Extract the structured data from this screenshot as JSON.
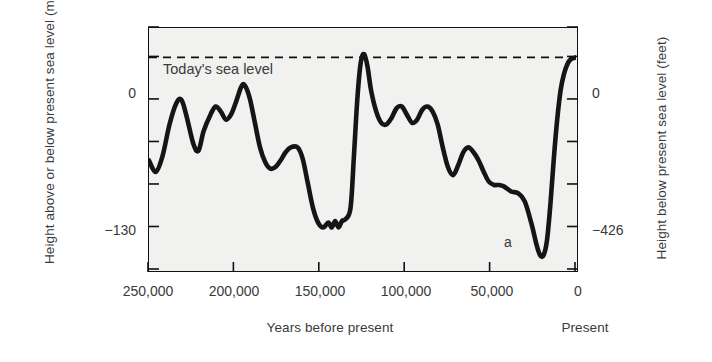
{
  "chart_data": {
    "type": "line",
    "title": "",
    "subtitle": "",
    "xlabel": "Years before present",
    "xlabel_right": "Present",
    "ylabel": "Height above or below present sea level (meters)",
    "ylabel_right": "Height below present sea level (feet)",
    "grid": false,
    "legend": "none",
    "xlim": [
      250000,
      0
    ],
    "ylim": [
      -130,
      18
    ],
    "y2lim": [
      -426,
      59
    ],
    "x_ticks": [
      250000,
      200000,
      150000,
      100000,
      50000,
      0
    ],
    "x_tick_labels": [
      "250,000",
      "200,000",
      "150,000",
      "100,000",
      "50,000",
      "0"
    ],
    "y_ticks": [
      0,
      -130
    ],
    "y_tick_labels": [
      "0",
      "−130"
    ],
    "y2_ticks": [
      0,
      -426
    ],
    "y2_tick_labels": [
      "0",
      "−426"
    ],
    "y_minor_ticks": [
      18,
      -26,
      -52,
      -78,
      -104
    ],
    "annotations": [
      {
        "text": "Today's sea level",
        "x": 232000,
        "y": 12
      },
      {
        "text": "a",
        "x": 17000,
        "y": -122
      }
    ],
    "reference_lines": [
      {
        "y": 0,
        "style": "dashed",
        "label": "Today's sea level"
      }
    ],
    "series": [
      {
        "name": "Sea level",
        "color": "#151515",
        "points": [
          [
            250000,
            -63
          ],
          [
            246000,
            -70
          ],
          [
            242000,
            -60
          ],
          [
            238000,
            -41
          ],
          [
            234000,
            -28
          ],
          [
            231000,
            -26
          ],
          [
            228000,
            -36
          ],
          [
            224000,
            -53
          ],
          [
            221000,
            -57
          ],
          [
            218000,
            -45
          ],
          [
            214000,
            -35
          ],
          [
            211000,
            -30
          ],
          [
            208000,
            -33
          ],
          [
            205000,
            -38
          ],
          [
            202000,
            -35
          ],
          [
            199000,
            -27
          ],
          [
            196000,
            -18
          ],
          [
            194000,
            -17
          ],
          [
            191000,
            -25
          ],
          [
            188000,
            -40
          ],
          [
            185000,
            -55
          ],
          [
            182000,
            -64
          ],
          [
            179000,
            -68
          ],
          [
            176000,
            -67
          ],
          [
            173000,
            -63
          ],
          [
            170000,
            -58
          ],
          [
            167000,
            -55
          ],
          [
            163000,
            -55
          ],
          [
            160000,
            -62
          ],
          [
            157000,
            -77
          ],
          [
            154000,
            -92
          ],
          [
            151000,
            -101
          ],
          [
            148000,
            -104
          ],
          [
            145000,
            -101
          ],
          [
            143000,
            -104
          ],
          [
            141000,
            -100
          ],
          [
            139000,
            -104
          ],
          [
            137000,
            -100
          ],
          [
            135000,
            -99
          ],
          [
            132000,
            -92
          ],
          [
            130000,
            -60
          ],
          [
            128000,
            -25
          ],
          [
            126000,
            -3
          ],
          [
            124000,
            2
          ],
          [
            122000,
            -6
          ],
          [
            120000,
            -20
          ],
          [
            117000,
            -33
          ],
          [
            114000,
            -40
          ],
          [
            111000,
            -41
          ],
          [
            108000,
            -37
          ],
          [
            105000,
            -31
          ],
          [
            102000,
            -30
          ],
          [
            99000,
            -35
          ],
          [
            96000,
            -40
          ],
          [
            93000,
            -38
          ],
          [
            90000,
            -32
          ],
          [
            87000,
            -30
          ],
          [
            84000,
            -33
          ],
          [
            81000,
            -41
          ],
          [
            78000,
            -55
          ],
          [
            75000,
            -67
          ],
          [
            72000,
            -72
          ],
          [
            69000,
            -66
          ],
          [
            66000,
            -58
          ],
          [
            63000,
            -55
          ],
          [
            60000,
            -58
          ],
          [
            57000,
            -63
          ],
          [
            54000,
            -70
          ],
          [
            51000,
            -76
          ],
          [
            48000,
            -78
          ],
          [
            45000,
            -78
          ],
          [
            42000,
            -79
          ],
          [
            38000,
            -82
          ],
          [
            34000,
            -83
          ],
          [
            30000,
            -88
          ],
          [
            26000,
            -102
          ],
          [
            23000,
            -115
          ],
          [
            21000,
            -121
          ],
          [
            19000,
            -121
          ],
          [
            17000,
            -112
          ],
          [
            15000,
            -90
          ],
          [
            13000,
            -62
          ],
          [
            11000,
            -38
          ],
          [
            9000,
            -20
          ],
          [
            7000,
            -10
          ],
          [
            5000,
            -4
          ],
          [
            3000,
            -1
          ],
          [
            0,
            0
          ]
        ]
      }
    ]
  },
  "axes": {
    "left_title": "Height above or below present sea level (meters)",
    "right_title": "Height below present sea level (feet)",
    "bottom_title": "Years before present",
    "bottom_right_title": "Present"
  },
  "plot": {
    "background_color": "#f1f1f0",
    "border_color": "#111111",
    "curve_color": "#151515",
    "dashed_line_color": "#111111"
  },
  "labels": {
    "sea_level_note": "Today's sea level",
    "annotation_a": "a"
  }
}
